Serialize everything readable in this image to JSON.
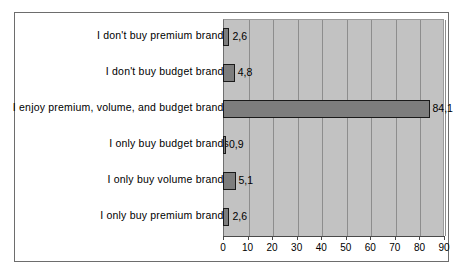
{
  "chart_data": {
    "type": "bar",
    "orientation": "horizontal",
    "title": "",
    "xlabel": "",
    "ylabel": "",
    "xlim": [
      0,
      90
    ],
    "xticks": [
      "0",
      "10",
      "20",
      "30",
      "40",
      "50",
      "60",
      "70",
      "80",
      "90"
    ],
    "grid": true,
    "legend": false,
    "decimal_separator": ",",
    "categories": [
      "I don't buy premium brands",
      "I don't buy budget brands",
      "I enjoy premium, volume, and budget brands",
      "I only buy budget brands",
      "I only buy volume brands",
      "I only buy premium brands"
    ],
    "values": [
      2.6,
      4.8,
      84.1,
      0.9,
      5.1,
      2.6
    ],
    "value_labels": [
      "2,6",
      "4,8",
      "84,1",
      "0,9",
      "5,1",
      "2,6"
    ],
    "colors": {
      "bar_fill": "#7d7d7d",
      "bar_edge": "#1a1a1a",
      "plot_background": "#c2c2c2",
      "gridline": "#8d8d8d",
      "axis": "#4a4a4a",
      "figure_border": "#6d6d6d",
      "text": "#000000"
    }
  }
}
